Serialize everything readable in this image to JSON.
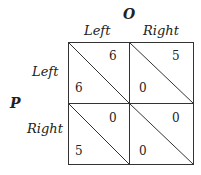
{
  "column_player": "O",
  "row_player": "P",
  "columns": [
    "Left",
    "Right"
  ],
  "rows": [
    "Left",
    "Right"
  ],
  "payoffs": [
    [
      {
        "row": "6",
        "col": "6"
      },
      {
        "row": "0",
        "col": "5"
      }
    ],
    [
      {
        "row": "5",
        "col": "0"
      },
      {
        "row": "0",
        "col": "0"
      }
    ]
  ]
}
